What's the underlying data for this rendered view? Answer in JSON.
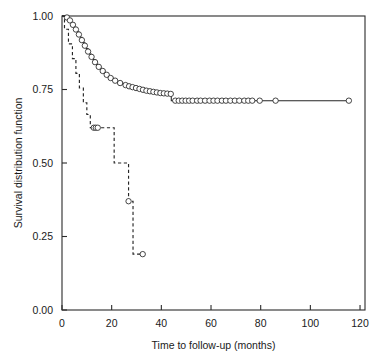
{
  "figure": {
    "background_color": "#ffffff",
    "ink_color": "#262626",
    "cut_off_header_text": "",
    "plot_area": {
      "left": 62,
      "top": 16,
      "right": 365,
      "bottom": 310
    }
  },
  "chart_data": {
    "type": "line",
    "subtype": "kaplan-meier-step",
    "title": "",
    "subtitle": "",
    "xlabel": "Time to follow-up (months)",
    "ylabel": "Survival distribution function",
    "xlim": [
      0,
      122
    ],
    "ylim": [
      0.0,
      1.0
    ],
    "xticks": [
      0,
      20,
      40,
      60,
      80,
      100,
      120
    ],
    "xtick_labels": [
      "0",
      "20",
      "40",
      "60",
      "80",
      "100",
      "120"
    ],
    "yticks": [
      0.0,
      0.25,
      0.5,
      0.75,
      1.0
    ],
    "ytick_labels": [
      "0.00",
      "0.25",
      "0.50",
      "0.75",
      "1.00"
    ],
    "grid": false,
    "legend": null,
    "legend_position": "none",
    "annotations": [],
    "marker": "open-circle",
    "marker_meaning": "censored observation",
    "series": [
      {
        "name": "Group 1 (solid)",
        "linestyle": "solid",
        "color": "#262626",
        "x": [
          0,
          1.2,
          2.0,
          2.6,
          3.2,
          3.8,
          4.4,
          5.0,
          5.6,
          6.2,
          6.8,
          7.4,
          8.0,
          8.6,
          9.2,
          9.8,
          10.5,
          11.2,
          11.9,
          12.6,
          13.3,
          14.0,
          14.8,
          15.6,
          16.4,
          17.2,
          18.0,
          18.8,
          19.6,
          20.5,
          21.4,
          22.4,
          23.4,
          24.5,
          25.6,
          26.8,
          28.0,
          29.2,
          30.4,
          31.6,
          32.8,
          34.0,
          35.2,
          36.4,
          37.6,
          38.8,
          40.0,
          41.3,
          42.6,
          44.0,
          45.2,
          46.5,
          48.0,
          50.0,
          52.0,
          54.0,
          56.0,
          58.0,
          60.0,
          62.0,
          64.0,
          66.0,
          68.0,
          70.0,
          72.0,
          74.0,
          76.0,
          78.0,
          80.0,
          86.0,
          115.5
        ],
        "y": [
          1.0,
          1.0,
          0.995,
          0.99,
          0.985,
          0.978,
          0.97,
          0.962,
          0.954,
          0.946,
          0.937,
          0.928,
          0.918,
          0.909,
          0.899,
          0.889,
          0.879,
          0.87,
          0.861,
          0.852,
          0.843,
          0.835,
          0.827,
          0.82,
          0.813,
          0.806,
          0.8,
          0.794,
          0.789,
          0.784,
          0.78,
          0.776,
          0.772,
          0.768,
          0.765,
          0.762,
          0.759,
          0.756,
          0.753,
          0.75,
          0.748,
          0.746,
          0.744,
          0.742,
          0.74,
          0.738,
          0.737,
          0.736,
          0.735,
          0.712,
          0.712,
          0.712,
          0.712,
          0.712,
          0.712,
          0.712,
          0.712,
          0.712,
          0.712,
          0.712,
          0.712,
          0.712,
          0.712,
          0.712,
          0.712,
          0.712,
          0.712,
          0.712,
          0.712,
          0.712,
          0.712
        ],
        "censored_points": [
          {
            "x": 2.0,
            "y": 0.995
          },
          {
            "x": 3.2,
            "y": 0.985
          },
          {
            "x": 4.4,
            "y": 0.97
          },
          {
            "x": 5.6,
            "y": 0.954
          },
          {
            "x": 6.8,
            "y": 0.937
          },
          {
            "x": 8.0,
            "y": 0.918
          },
          {
            "x": 9.2,
            "y": 0.899
          },
          {
            "x": 10.5,
            "y": 0.879
          },
          {
            "x": 11.9,
            "y": 0.861
          },
          {
            "x": 13.3,
            "y": 0.843
          },
          {
            "x": 14.8,
            "y": 0.827
          },
          {
            "x": 16.4,
            "y": 0.813
          },
          {
            "x": 18.0,
            "y": 0.8
          },
          {
            "x": 19.6,
            "y": 0.789
          },
          {
            "x": 21.4,
            "y": 0.78
          },
          {
            "x": 23.4,
            "y": 0.772
          },
          {
            "x": 25.6,
            "y": 0.765
          },
          {
            "x": 27.0,
            "y": 0.761
          },
          {
            "x": 28.4,
            "y": 0.758
          },
          {
            "x": 29.8,
            "y": 0.755
          },
          {
            "x": 31.2,
            "y": 0.752
          },
          {
            "x": 32.6,
            "y": 0.749
          },
          {
            "x": 34.0,
            "y": 0.746
          },
          {
            "x": 35.4,
            "y": 0.744
          },
          {
            "x": 36.8,
            "y": 0.742
          },
          {
            "x": 38.2,
            "y": 0.74
          },
          {
            "x": 39.6,
            "y": 0.738
          },
          {
            "x": 41.0,
            "y": 0.737
          },
          {
            "x": 42.4,
            "y": 0.736
          },
          {
            "x": 43.8,
            "y": 0.735
          },
          {
            "x": 45.6,
            "y": 0.712
          },
          {
            "x": 47.0,
            "y": 0.712
          },
          {
            "x": 48.4,
            "y": 0.712
          },
          {
            "x": 49.8,
            "y": 0.712
          },
          {
            "x": 51.2,
            "y": 0.712
          },
          {
            "x": 52.6,
            "y": 0.712
          },
          {
            "x": 54.4,
            "y": 0.712
          },
          {
            "x": 55.8,
            "y": 0.712
          },
          {
            "x": 57.6,
            "y": 0.712
          },
          {
            "x": 59.4,
            "y": 0.712
          },
          {
            "x": 61.0,
            "y": 0.712
          },
          {
            "x": 62.6,
            "y": 0.712
          },
          {
            "x": 64.4,
            "y": 0.712
          },
          {
            "x": 66.0,
            "y": 0.712
          },
          {
            "x": 67.8,
            "y": 0.712
          },
          {
            "x": 69.6,
            "y": 0.712
          },
          {
            "x": 71.4,
            "y": 0.712
          },
          {
            "x": 73.4,
            "y": 0.712
          },
          {
            "x": 75.0,
            "y": 0.712
          },
          {
            "x": 76.6,
            "y": 0.712
          },
          {
            "x": 79.6,
            "y": 0.712
          },
          {
            "x": 86.0,
            "y": 0.712
          },
          {
            "x": 115.5,
            "y": 0.712
          }
        ]
      },
      {
        "name": "Group 2 (dashed)",
        "linestyle": "dashed",
        "color": "#262626",
        "x": [
          0,
          1.0,
          1.0,
          2.6,
          2.6,
          4.2,
          4.2,
          5.6,
          5.6,
          7.0,
          7.0,
          8.6,
          8.6,
          10.0,
          10.0,
          11.4,
          11.4,
          12.4,
          12.4,
          21.0,
          21.0,
          26.8,
          26.8,
          28.6,
          28.6,
          32.5
        ],
        "y": [
          1.0,
          1.0,
          0.955,
          0.955,
          0.905,
          0.905,
          0.855,
          0.855,
          0.805,
          0.805,
          0.755,
          0.755,
          0.705,
          0.705,
          0.665,
          0.665,
          0.62,
          0.62,
          0.62,
          0.62,
          0.5,
          0.5,
          0.37,
          0.37,
          0.19,
          0.19
        ],
        "censored_points": [
          {
            "x": 12.8,
            "y": 0.62
          },
          {
            "x": 13.6,
            "y": 0.62
          },
          {
            "x": 14.4,
            "y": 0.62
          },
          {
            "x": 26.8,
            "y": 0.37
          },
          {
            "x": 32.5,
            "y": 0.19
          }
        ]
      }
    ]
  }
}
